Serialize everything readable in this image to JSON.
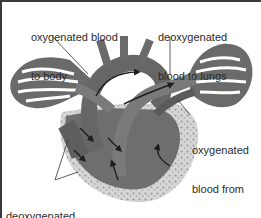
{
  "diagram": {
    "labels": {
      "oxygenated_to_body": {
        "line1": "oxygenated blood",
        "line2": "to body"
      },
      "deoxygenated_to_lungs": {
        "line1": "deoxygenated",
        "line2": "blood to lungs"
      },
      "oxygenated_from_lungs": {
        "line1": "oxygenated",
        "line2": "blood from",
        "line3": "lungs"
      },
      "deoxygenated_from_body": {
        "line1": "deoxygenated",
        "line2": "blood from body"
      }
    },
    "colors": {
      "vessel_dark": "#5e5e5e",
      "vessel_mid": "#7a7a7a",
      "muscle_light": "#d9d9d9",
      "arrow": "#1e1e1e",
      "text": "#2b2b2b",
      "border": "#3a3a3a"
    }
  }
}
